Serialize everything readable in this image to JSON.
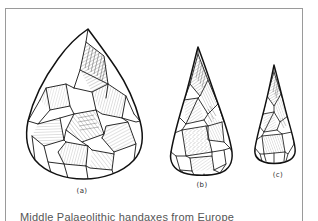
{
  "figure": {
    "caption": "Middle Palaeolithic handaxes from Europe",
    "background_color": "#ffffff",
    "frame_color": "#9a9a9a",
    "ink_color": "#1a1a1a",
    "specimens": [
      {
        "id": "a",
        "label": "(a)",
        "name": "large-cordiform-handaxe",
        "shape": "cordiform teardrop biface, rounded base, broad body",
        "relative_size": "largest"
      },
      {
        "id": "b",
        "label": "(b)",
        "name": "medium-pointed-handaxe",
        "shape": "elongated pointed biface, truncated base with cortex patch",
        "relative_size": "medium"
      },
      {
        "id": "c",
        "label": "(c)",
        "name": "small-pointed-handaxe",
        "shape": "slender narrow point, flat base",
        "relative_size": "smallest"
      }
    ]
  }
}
